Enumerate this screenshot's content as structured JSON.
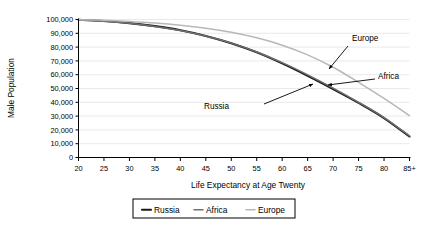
{
  "chart_data": {
    "type": "line",
    "title": "",
    "xlabel": "Life Expectancy at Age Twenty",
    "ylabel": "Male Population",
    "x": [
      20,
      25,
      30,
      35,
      40,
      45,
      50,
      55,
      60,
      65,
      70,
      75,
      80,
      85
    ],
    "xtick_labels": [
      "20",
      "25",
      "30",
      "35",
      "40",
      "45",
      "50",
      "55",
      "60",
      "65",
      "70",
      "75",
      "80",
      "85+"
    ],
    "ytick_labels": [
      "0",
      "10,000",
      "20,000",
      "30,000",
      "40,000",
      "50,000",
      "60,000",
      "70,000",
      "80,000",
      "90,000",
      "100,000"
    ],
    "ytick_values": [
      0,
      10000,
      20000,
      30000,
      40000,
      50000,
      60000,
      70000,
      80000,
      90000,
      100000
    ],
    "ylim": [
      0,
      100000
    ],
    "xlim": [
      20,
      85
    ],
    "grid": "horizontal",
    "legend_position": "bottom",
    "series": [
      {
        "name": "Russia",
        "color": "#1a1a1a",
        "width": 2.1,
        "values": [
          99800,
          98900,
          97400,
          95200,
          92200,
          88100,
          82800,
          76200,
          68200,
          59200,
          49600,
          39600,
          28600,
          15200
        ]
      },
      {
        "name": "Africa",
        "color": "#707070",
        "width": 1.5,
        "values": [
          99700,
          98700,
          97200,
          95000,
          92000,
          88000,
          82900,
          76500,
          68700,
          59900,
          50300,
          40000,
          28900,
          15600
        ]
      },
      {
        "name": "Europe",
        "color": "#b8b8b8",
        "width": 1.5,
        "values": [
          99900,
          99400,
          98600,
          97500,
          95900,
          93700,
          90700,
          86700,
          81400,
          74400,
          65400,
          54500,
          42800,
          30300
        ]
      }
    ],
    "annotations": [
      {
        "text": "Europe",
        "label_x": 352,
        "label_y": 41,
        "arrow_from_x": 348,
        "arrow_from_y": 46,
        "arrow_to_x": 329,
        "arrow_to_y": 69
      },
      {
        "text": "Africa",
        "label_x": 378,
        "label_y": 79,
        "arrow_from_x": 375,
        "arrow_from_y": 79,
        "arrow_to_x": 328,
        "arrow_to_y": 85
      },
      {
        "text": "Russia",
        "label_x": 229,
        "label_y": 109,
        "arrow_from_x": 264,
        "arrow_from_y": 104,
        "arrow_to_x": 313,
        "arrow_to_y": 84
      }
    ]
  },
  "legend": {
    "items": [
      {
        "label": "Russia"
      },
      {
        "label": "Africa"
      },
      {
        "label": "Europe"
      }
    ]
  }
}
